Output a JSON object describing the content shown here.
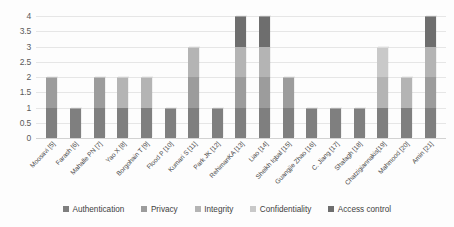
{
  "chart_data": {
    "type": "bar",
    "stacked": true,
    "title": "",
    "xlabel": "",
    "ylabel": "",
    "ylim": [
      0,
      4
    ],
    "yticks": [
      "0",
      "0.5",
      "1",
      "1.5",
      "2",
      "2.5",
      "3",
      "3.5",
      "4"
    ],
    "grid": true,
    "legend_position": "bottom",
    "categories": [
      "Moosavi [5]",
      "Farash [6]",
      "Mahalle PN [7]",
      "Yao X [8]",
      "Borgohain T [9]",
      "Flood P [10]",
      "Kumari S [11]",
      "Park JK [12]",
      "RehimanKA [13]",
      "Liao [14]",
      "Sheikh Iqbal [15]",
      "Guangjie Zhao [16]",
      "C. Jiang [17]",
      "Shafagh [18]",
      "Chatzigiannakis[19]",
      "Mahmood [20]",
      "Amin [21]"
    ],
    "series": [
      {
        "name": "Authentication",
        "color": "#7f7f7f",
        "values": [
          1,
          1,
          1,
          1,
          1,
          1,
          1,
          1,
          1,
          1,
          1,
          1,
          1,
          1,
          1,
          1,
          1
        ]
      },
      {
        "name": "Privacy",
        "color": "#9c9c9c",
        "values": [
          1,
          0,
          1,
          0,
          0,
          0,
          1,
          0,
          1,
          1,
          1,
          0,
          0,
          0,
          0,
          0,
          1
        ]
      },
      {
        "name": "Integrity",
        "color": "#b4b4b4",
        "values": [
          0,
          0,
          0,
          1,
          1,
          0,
          1,
          0,
          1,
          1,
          0,
          0,
          0,
          0,
          1,
          1,
          1
        ]
      },
      {
        "name": "Confidentiality",
        "color": "#c9c9c9",
        "values": [
          0,
          0,
          0,
          0,
          0,
          0,
          0,
          0,
          0,
          0,
          0,
          0,
          0,
          0,
          1,
          0,
          0
        ]
      },
      {
        "name": "Access control",
        "color": "#6e6e6e",
        "values": [
          0,
          0,
          0,
          0,
          0,
          0,
          0,
          0,
          1,
          1,
          0,
          0,
          0,
          0,
          0,
          0,
          1
        ]
      }
    ],
    "totals": [
      2,
      1,
      2,
      2,
      2,
      1,
      3,
      1,
      4,
      4,
      2,
      1,
      1,
      1,
      3,
      2,
      4
    ]
  },
  "colors": {
    "gridline": "#e6e6e6",
    "axis": "#d2d2d2",
    "tick_text": "#5a5a5a",
    "label_text": "#4a4a4a",
    "background": "#fdfdfd"
  }
}
